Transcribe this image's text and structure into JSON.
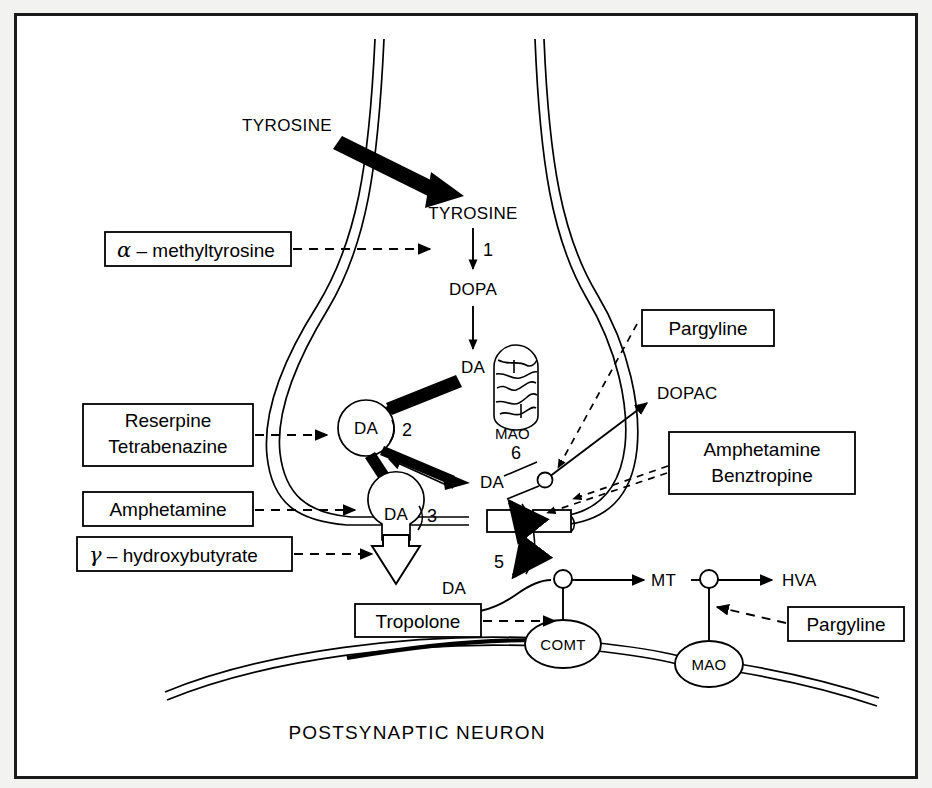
{
  "figure": {
    "kind": "biology-diagram",
    "bottom_label": "POSTSYNAPTIC   NEURON",
    "frame_color": "#1a1a1a",
    "background_color": "#ffffff",
    "page_background": "#f2f2f0",
    "ink_color": "#000000"
  },
  "pathway_labels": {
    "tyrosine_external": "TYROSINE",
    "tyrosine_internal": "TYROSINE",
    "dopa": "DOPA",
    "da_cytosol": "DA",
    "da_vesicle_2": "DA",
    "da_vesicle_3": "DA",
    "da_released": "DA",
    "da_cleft": "DA",
    "dopac": "DOPAC",
    "mt": "MT",
    "hva": "HVA"
  },
  "enzymes": {
    "mao_terminal": "MAO",
    "comt_post": "COMT",
    "mao_post": "MAO"
  },
  "step_numbers": {
    "step1": "1",
    "step2": "2",
    "step3": "3",
    "step5": "5",
    "step6": "6"
  },
  "drug_boxes": [
    {
      "id": "alpha-methyltyrosine",
      "greek": "α",
      "text": " – methyltyrosine",
      "full": "α – methyltyrosine"
    },
    {
      "id": "reserpine-tetrabenazine",
      "line1": "Reserpine",
      "line2": "Tetrabenazine"
    },
    {
      "id": "amphetamine-left",
      "text": "Amphetamine"
    },
    {
      "id": "gamma-hydroxybutyrate",
      "greek": "γ",
      "text": " – hydroxybutyrate",
      "full": "γ – hydroxybutyrate"
    },
    {
      "id": "pargyline-top",
      "text": "Pargyline"
    },
    {
      "id": "amphetamine-benztropine",
      "line1": "Amphetamine",
      "line2": "Benztropine"
    },
    {
      "id": "tropolone",
      "text": "Tropolone"
    },
    {
      "id": "pargyline-bottom",
      "text": "Pargyline"
    }
  ]
}
